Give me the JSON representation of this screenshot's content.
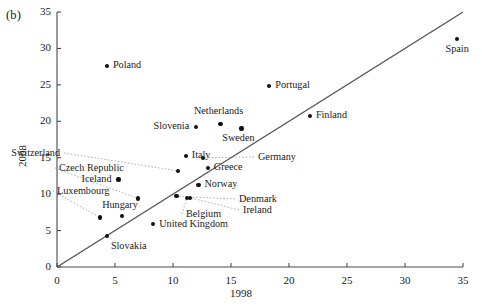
{
  "panel": {
    "label": "(b)"
  },
  "axes": {
    "xlabel": "1998",
    "ylabel": "2008",
    "xticks": [
      "0",
      "5",
      "10",
      "15",
      "20",
      "25",
      "30",
      "35"
    ],
    "yticks": [
      "0",
      "5",
      "10",
      "15",
      "20",
      "25",
      "30",
      "35"
    ]
  },
  "chart_data": {
    "type": "scatter",
    "title": "",
    "xlabel": "1998",
    "ylabel": "2008",
    "xlim": [
      0,
      35
    ],
    "ylim": [
      0,
      35
    ],
    "xticks": [
      0,
      5,
      10,
      15,
      20,
      25,
      30,
      35
    ],
    "yticks": [
      0,
      5,
      10,
      15,
      20,
      25,
      30,
      35
    ],
    "grid": false,
    "legend": "none",
    "reference_line": {
      "description": "45-degree identity line y = x",
      "from": [
        0,
        0
      ],
      "to": [
        35,
        35
      ]
    },
    "points": [
      {
        "name": "Poland",
        "x": 4.3,
        "y": 27.6,
        "label_pos": "right"
      },
      {
        "name": "Spain",
        "x": 34.5,
        "y": 31.3,
        "label_pos": "below"
      },
      {
        "name": "Portugal",
        "x": 18.3,
        "y": 24.8,
        "label_pos": "right"
      },
      {
        "name": "Finland",
        "x": 21.8,
        "y": 20.7,
        "label_pos": "right"
      },
      {
        "name": "Netherlands",
        "x": 14.1,
        "y": 19.6,
        "label_pos": "above"
      },
      {
        "name": "Slovenia",
        "x": 12.0,
        "y": 19.2,
        "label_pos": "left"
      },
      {
        "name": "Sweden",
        "x": 15.9,
        "y": 19.0,
        "label_pos": "below"
      },
      {
        "name": "Italy",
        "x": 11.1,
        "y": 15.2,
        "label_pos": "right"
      },
      {
        "name": "Germany",
        "x": 12.6,
        "y": 15.0,
        "label_pos": "leader-right"
      },
      {
        "name": "Switzerland",
        "x": 10.4,
        "y": 13.2,
        "label_pos": "leader-left"
      },
      {
        "name": "Greece",
        "x": 13.0,
        "y": 13.6,
        "label_pos": "right"
      },
      {
        "name": "Iceland",
        "x": 5.3,
        "y": 12.0,
        "label_pos": "left"
      },
      {
        "name": "Norway",
        "x": 12.2,
        "y": 11.2,
        "label_pos": "right"
      },
      {
        "name": "Czech Republic",
        "x": 7.0,
        "y": 9.4,
        "label_pos": "leader-upleft"
      },
      {
        "name": "Denmark",
        "x": 10.3,
        "y": 9.7,
        "label_pos": "leader-right"
      },
      {
        "name": "Belgium",
        "x": 11.2,
        "y": 9.5,
        "label_pos": "leader-below"
      },
      {
        "name": "Ireland",
        "x": 11.5,
        "y": 9.5,
        "label_pos": "leader-right"
      },
      {
        "name": "Luxembourg",
        "x": 3.7,
        "y": 6.8,
        "label_pos": "leader-upleft"
      },
      {
        "name": "Hungary",
        "x": 5.6,
        "y": 7.0,
        "label_pos": "above"
      },
      {
        "name": "United Kingdom",
        "x": 8.3,
        "y": 5.9,
        "label_pos": "right"
      },
      {
        "name": "Slovakia",
        "x": 4.3,
        "y": 4.3,
        "label_pos": "below-right"
      }
    ]
  },
  "style": {
    "point_color": "#101010",
    "axis_color": "#4a4a4a",
    "line_color": "#555555",
    "leader_color": "#9a9a9a",
    "background": "#ffffff"
  },
  "labels": {
    "poland": "Poland",
    "spain": "Spain",
    "portugal": "Portugal",
    "finland": "Finland",
    "netherlands": "Netherlands",
    "slovenia": "Slovenia",
    "sweden": "Sweden",
    "italy": "Italy",
    "germany": "Germany",
    "switzerland": "Switzerland",
    "greece": "Greece",
    "iceland": "Iceland",
    "norway": "Norway",
    "czech_republic": "Czech Republic",
    "denmark": "Denmark",
    "belgium": "Belgium",
    "ireland": "Ireland",
    "luxembourg": "Luxembourg",
    "hungary": "Hungary",
    "united_kingdom": "United Kingdom",
    "slovakia": "Slovakia"
  }
}
